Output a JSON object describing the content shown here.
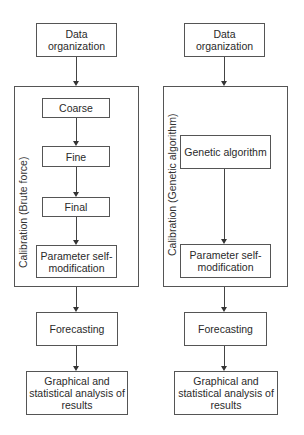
{
  "left_flow": {
    "data_org": "Data organization",
    "container_label": "Calibration (Brute force)",
    "steps": [
      "Coarse",
      "Fine",
      "Final"
    ],
    "param": "Parameter self-modification",
    "forecasting": "Forecasting",
    "analysis": "Graphical and statistical analysis of results"
  },
  "right_flow": {
    "data_org": "Data organization",
    "container_label": "Calibration (Genetic algorithm)",
    "genetic": "Genetic algorithm",
    "param": "Parameter self-modification",
    "forecasting": "Forecasting",
    "analysis": "Graphical and statistical analysis of results"
  },
  "colors": {
    "stroke": "#555555",
    "text": "#2a2a2a",
    "background": "#ffffff"
  }
}
